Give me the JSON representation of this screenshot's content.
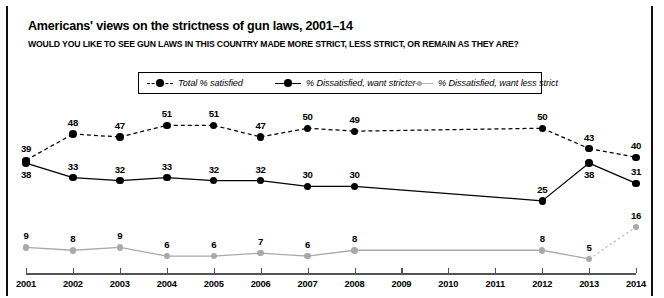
{
  "header": {
    "title": "Americans' views on the strictness of gun laws, 2001–14",
    "subtitle": "WOULD YOU LIKE TO SEE GUN LAWS IN THIS COUNTRY MADE MORE STRICT, LESS STRICT, OR REMAIN AS THEY ARE?"
  },
  "colors": {
    "series_satisfied": "#000000",
    "series_stricter": "#000000",
    "series_less_strict": "#a9a9a9",
    "axis": "#555555",
    "border": "#111111",
    "background": "#ffffff"
  },
  "chart_data": {
    "type": "line",
    "title": "Americans' views on the strictness of gun laws, 2001–14",
    "subtitle": "WOULD YOU LIKE TO SEE GUN LAWS IN THIS COUNTRY MADE MORE STRICT, LESS STRICT, OR REMAIN AS THEY ARE?",
    "xlabel": "",
    "ylabel": "",
    "ylim": [
      0,
      55
    ],
    "grid": false,
    "legend_position": "top-center",
    "categories": [
      "2001",
      "2002",
      "2003",
      "2004",
      "2005",
      "2006",
      "2007",
      "2008",
      "2009",
      "2010",
      "2011",
      "2012",
      "2013",
      "2014"
    ],
    "series": [
      {
        "name": "Total % satisfied",
        "style": "dashed",
        "marker": "circle",
        "color": "#000000",
        "values": [
          39,
          48,
          47,
          51,
          51,
          47,
          50,
          49,
          null,
          null,
          null,
          50,
          43,
          40
        ],
        "label_positions": [
          "above",
          "above",
          "above",
          "above",
          "above",
          "above",
          "above",
          "above",
          null,
          null,
          null,
          "above",
          "above",
          "above"
        ]
      },
      {
        "name": "% Dissatisfied, want stricter",
        "style": "solid",
        "marker": "circle",
        "color": "#000000",
        "values": [
          38,
          33,
          32,
          33,
          32,
          32,
          30,
          30,
          null,
          null,
          null,
          25,
          38,
          31
        ],
        "label_positions": [
          "below",
          "above",
          "above",
          "above",
          "above",
          "above",
          "above",
          "above",
          null,
          null,
          null,
          "above",
          "below",
          "above"
        ]
      },
      {
        "name": "% Dissatisfied, want less strict",
        "style": "solid",
        "marker": "circle",
        "color": "#a9a9a9",
        "values": [
          9,
          8,
          9,
          6,
          6,
          7,
          6,
          8,
          null,
          null,
          null,
          8,
          5,
          16
        ],
        "label_positions": [
          "above",
          "above",
          "above",
          "above",
          "above",
          "above",
          "above",
          "above",
          null,
          null,
          null,
          "above",
          "above",
          "above"
        ]
      }
    ]
  },
  "legend": {
    "items": [
      {
        "label": "Total % satisfied",
        "marker": "dashed-black-dot-icon"
      },
      {
        "label": "% Dissatisfied, want stricter",
        "marker": "solid-black-dot-icon"
      },
      {
        "label": "% Dissatisfied, want less strict",
        "marker": "gray-dot-icon"
      }
    ]
  }
}
